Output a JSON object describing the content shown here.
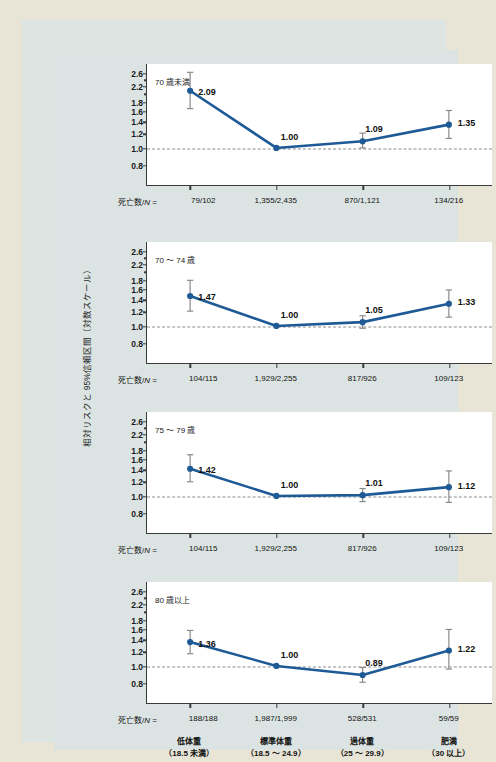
{
  "figure": {
    "ylabel": "相対リスクと 95%信頼区間（対数スケール）",
    "n_prefix_text": "死亡数/",
    "n_prefix_italic": "N",
    "n_prefix_eq": " = ",
    "accent_color": "#1d5a96",
    "errorbar_color": "#8a8a8a",
    "refline_color": "#8d8d8d",
    "panel_bg": "#ffffff",
    "figure_bg": "#dce4e3",
    "page_bg": "#e8e5d6"
  },
  "axis": {
    "yticks_labeled": [
      "2.6",
      "2.2",
      "1.8",
      "1.6",
      "1.4",
      "1.2",
      "1.0",
      "0.8"
    ],
    "ytick_values": [
      2.6,
      2.2,
      1.8,
      1.6,
      1.4,
      1.2,
      1.0,
      0.8
    ],
    "ymin": 0.62,
    "ymax": 2.95,
    "scale": "log",
    "reference_value": 1.0
  },
  "categories": [
    {
      "name": "低体重",
      "range": "（18.5 未満）"
    },
    {
      "name": "標準体重",
      "range": "（18.5 ～ 24.9）"
    },
    {
      "name": "過体重",
      "range": "（25 ～ 29.9）"
    },
    {
      "name": "肥満",
      "range": "（30 以上）"
    }
  ],
  "chart_data": {
    "type": "line",
    "title": "",
    "xlabel": "",
    "ylabel": "相対リスクと 95%信頼区間（対数スケール）",
    "scale": "log",
    "ylim": [
      0.62,
      2.95
    ],
    "yticks": [
      2.6,
      2.2,
      1.8,
      1.6,
      1.4,
      1.2,
      1.0,
      0.8
    ],
    "grid": false,
    "legend": "none",
    "reference_line": 1.0,
    "categories": [
      "低体重（18.5 未満）",
      "標準体重（18.5 ～ 24.9）",
      "過体重（25 ～ 29.9）",
      "肥満（30 以上）"
    ],
    "panels": [
      {
        "label": "70 歳未満",
        "values": [
          2.09,
          1.0,
          1.09,
          1.35
        ],
        "ci_low": [
          1.66,
          1.0,
          1.0,
          1.13
        ],
        "ci_high": [
          2.65,
          1.0,
          1.21,
          1.62
        ],
        "deaths_n": [
          "79/102",
          "1,355/2,435",
          "870/1,121",
          "134/216"
        ]
      },
      {
        "label": "70 ～ 74 歳",
        "values": [
          1.47,
          1.0,
          1.05,
          1.33
        ],
        "ci_low": [
          1.21,
          1.0,
          0.97,
          1.12
        ],
        "ci_high": [
          1.8,
          1.0,
          1.14,
          1.59
        ],
        "deaths_n": [
          "104/115",
          "1,929/2,255",
          "817/926",
          "109/123"
        ]
      },
      {
        "label": "75 ～ 79 歳",
        "values": [
          1.42,
          1.0,
          1.01,
          1.12
        ],
        "ci_low": [
          1.2,
          1.0,
          0.93,
          0.92
        ],
        "ci_high": [
          1.7,
          1.0,
          1.1,
          1.38
        ],
        "deaths_n": [
          "104/115",
          "1,929/2,255",
          "817/926",
          "109/123"
        ]
      },
      {
        "label": "80 歳以上",
        "values": [
          1.36,
          1.0,
          0.89,
          1.22
        ],
        "ci_low": [
          1.17,
          1.0,
          0.81,
          0.96
        ],
        "ci_high": [
          1.58,
          1.0,
          0.98,
          1.6
        ],
        "deaths_n": [
          "188/188",
          "1,987/1,999",
          "528/531",
          "59/59"
        ]
      }
    ]
  }
}
